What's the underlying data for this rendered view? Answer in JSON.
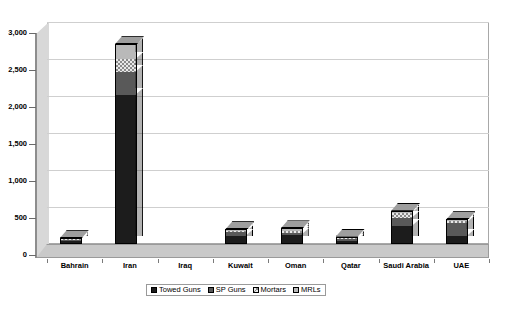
{
  "chart_data": {
    "type": "bar",
    "subtype": "stacked-column-3d",
    "title": "",
    "subtitle": "",
    "xlabel": "",
    "ylabel": "",
    "ylim": [
      0,
      3000
    ],
    "ytick_step": 500,
    "grid": true,
    "legend_position": "bottom",
    "categories": [
      "Bahrain",
      "Iran",
      "Iraq",
      "Kuwait",
      "Oman",
      "Qatar",
      "Saudi Arabia",
      "UAE"
    ],
    "ytick_labels": [
      "0",
      "500",
      "1,000",
      "1,500",
      "2,000",
      "2,500",
      "3,000"
    ],
    "ytick_values": [
      0,
      500,
      1000,
      1500,
      2000,
      2500,
      3000
    ],
    "series": [
      {
        "name": "Towed Guns",
        "color": "#1c1c1c",
        "pattern": "solid-black",
        "values": [
          36,
          2010,
          0,
          108,
          120,
          45,
          238,
          106
        ]
      },
      {
        "name": "SP Guns",
        "color": "#595959",
        "pattern": "solid-dark-gray",
        "values": [
          13,
          310,
          0,
          50,
          24,
          28,
          110,
          181
        ]
      },
      {
        "name": "Mortars",
        "color": "#e8e8e8",
        "pattern": "checkered",
        "values": [
          12,
          175,
          0,
          14,
          30,
          15,
          68,
          23
        ]
      },
      {
        "name": "MRLs",
        "color": "#b9b9b9",
        "pattern": "solid-light-gray",
        "values": [
          9,
          205,
          0,
          27,
          36,
          12,
          34,
          24
        ]
      }
    ],
    "totals": [
      70,
      2700,
      0,
      199,
      210,
      100,
      450,
      334
    ]
  },
  "legend": {
    "items": [
      {
        "label": "Towed Guns"
      },
      {
        "label": "SP Guns"
      },
      {
        "label": "Mortars"
      },
      {
        "label": "MRLs"
      }
    ]
  }
}
